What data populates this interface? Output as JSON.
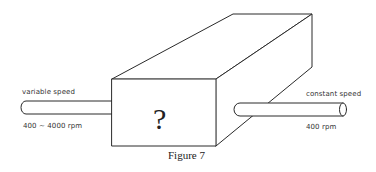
{
  "figure": {
    "caption": "Figure 7",
    "box_label": "?",
    "input_shaft": {
      "title": "variable speed",
      "speed": "400 ~ 4000 rpm"
    },
    "output_shaft": {
      "title": "constant speed",
      "speed": "400 rpm"
    },
    "colors": {
      "stroke": "#2a2a2a",
      "background": "#ffffff"
    }
  }
}
